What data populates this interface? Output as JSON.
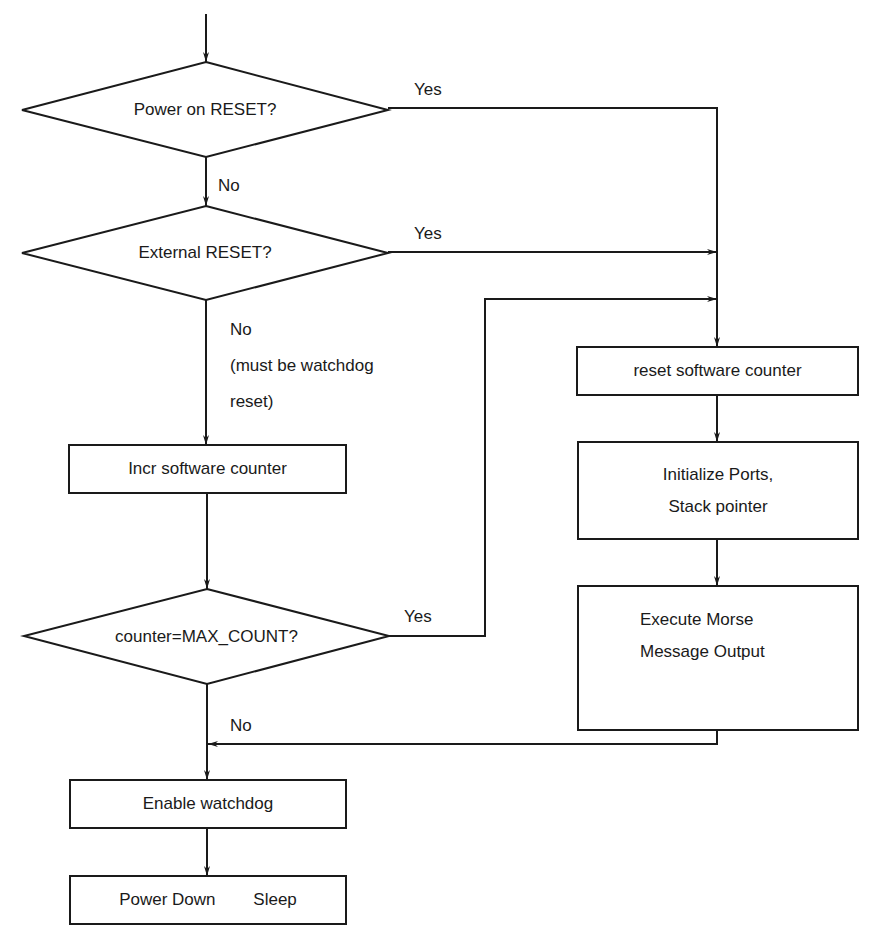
{
  "diagram": {
    "type": "flowchart",
    "colors": {
      "stroke": "#1a1a1a",
      "background": "#ffffff"
    },
    "decisions": [
      {
        "id": "power_on_reset",
        "text": "Power on RESET?"
      },
      {
        "id": "external_reset",
        "text": "External RESET?"
      },
      {
        "id": "max_count",
        "text": "counter=MAX_COUNT?"
      }
    ],
    "processes": [
      {
        "id": "incr_counter",
        "text": "Incr software counter"
      },
      {
        "id": "reset_counter",
        "text": "reset software counter"
      },
      {
        "id": "init_ports",
        "lines": [
          "Initialize Ports,",
          "Stack pointer"
        ]
      },
      {
        "id": "execute_morse",
        "lines": [
          "Execute Morse",
          "Message Output"
        ]
      },
      {
        "id": "enable_watchdog",
        "text": "Enable watchdog"
      },
      {
        "id": "power_down",
        "text": "Power Down        Sleep"
      }
    ],
    "edge_labels": {
      "power_yes": "Yes",
      "power_no": "No",
      "external_yes": "Yes",
      "external_no_lines": [
        "No",
        "(must be watchdog",
        "reset)"
      ],
      "max_yes": "Yes",
      "max_no": "No"
    }
  }
}
